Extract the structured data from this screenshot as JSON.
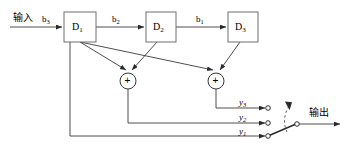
{
  "diagram": {
    "input_label": "输入",
    "output_label": "输出",
    "line_color": "#3a3a3a",
    "box_border_color": "#6e6e6e",
    "text_color": "#000000",
    "background_color": "#ffffff",
    "blocks": [
      {
        "name": "D",
        "sub": "1",
        "x": 64,
        "y": 12,
        "w": 32,
        "h": 30
      },
      {
        "name": "D",
        "sub": "2",
        "x": 146,
        "y": 12,
        "w": 30,
        "h": 30
      },
      {
        "name": "D",
        "sub": "3",
        "x": 228,
        "y": 12,
        "w": 30,
        "h": 30
      }
    ],
    "signal_labels": [
      {
        "name": "b",
        "sub": "3",
        "x": 42,
        "y": 15
      },
      {
        "name": "b",
        "sub": "2",
        "x": 112,
        "y": 15
      },
      {
        "name": "b",
        "sub": "1",
        "x": 196,
        "y": 15
      }
    ],
    "adders": [
      {
        "symbol": "+",
        "cx": 128,
        "cy": 81,
        "r": 8
      },
      {
        "symbol": "+",
        "cx": 216,
        "cy": 81,
        "r": 8
      }
    ],
    "outputs": [
      {
        "name": "y",
        "sub": "3",
        "label_x": 239,
        "label_y": 98,
        "terminal_x": 267,
        "terminal_y": 108
      },
      {
        "name": "y",
        "sub": "2",
        "label_x": 239,
        "label_y": 113,
        "terminal_x": 267,
        "terminal_y": 123
      },
      {
        "name": "y",
        "sub": "1",
        "label_x": 239,
        "label_y": 127,
        "terminal_x": 267,
        "terminal_y": 136
      }
    ],
    "switch": {
      "name": "rotary-selector-switch",
      "pivot_x": 296,
      "pivot_y": 124,
      "wiper_to_x": 268,
      "wiper_to_y": 136
    }
  }
}
